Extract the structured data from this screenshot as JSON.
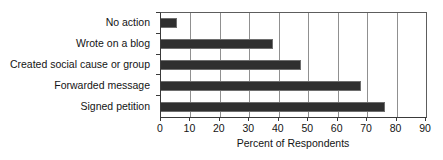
{
  "chart_data": {
    "type": "bar",
    "orientation": "horizontal",
    "title": "",
    "subtitle": "",
    "xlabel": "Percent of Respondents",
    "ylabel": "",
    "categories": [
      "No action",
      "Wrote on a blog",
      "Created social cause or group",
      "Forwarded message",
      "Signed petition"
    ],
    "values": [
      5.5,
      38,
      47.5,
      68,
      76
    ],
    "xlim": [
      0,
      90
    ],
    "xticks": [
      0,
      10,
      20,
      30,
      40,
      50,
      60,
      70,
      80,
      90
    ],
    "xtick_labels": [
      "0",
      "10",
      "20",
      "30",
      "40",
      "50",
      "60",
      "70",
      "80",
      "90"
    ],
    "grid": "vertical",
    "legend": "none",
    "bar_color": "#2f2f2f",
    "bar_edge_color": "#6e6e6e",
    "gridline_color": "#909090",
    "axis_color": "#3a3a3a",
    "background_color": "#ffffff",
    "bars": [
      {
        "label": "No action",
        "value": 5.5
      },
      {
        "label": "Wrote on a blog",
        "value": 38
      },
      {
        "label": "Created social cause or group",
        "value": 47.5
      },
      {
        "label": "Forwarded message",
        "value": 68
      },
      {
        "label": "Signed petition",
        "value": 76
      }
    ]
  }
}
